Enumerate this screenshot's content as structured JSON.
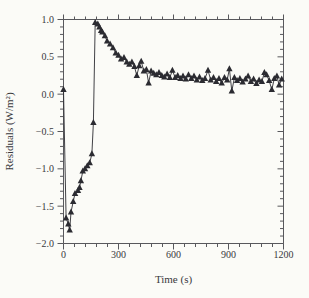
{
  "chart_data": {
    "type": "line",
    "title": "",
    "xlabel": "Time (s)",
    "ylabel": "Residuals (W/m²)",
    "xlim": [
      0,
      1200
    ],
    "ylim": [
      -2.0,
      1.0
    ],
    "x_major_ticks": [
      0,
      300,
      600,
      900,
      1200
    ],
    "x_tick_labels": [
      "0",
      "300",
      "600",
      "900",
      "1200"
    ],
    "x_minor_step": 60,
    "y_major_ticks": [
      1.0,
      0.5,
      0.0,
      -0.5,
      -1.0,
      -1.5,
      -2.0
    ],
    "y_tick_labels": [
      "1.0",
      "0.5",
      "0.0",
      "−0.5",
      "−1.0",
      "−1.5",
      "−2.0"
    ],
    "y_minor_step": 0.1,
    "grid": false,
    "legend_position": "none",
    "marker": "filled-triangle-up",
    "colors": {
      "series": "#2b2b31",
      "axis": "#58585c",
      "text": "#39393d",
      "background": "#fbfbf7"
    },
    "series": [
      {
        "name": "residuals",
        "points": [
          [
            0,
            0.06
          ],
          [
            14,
            -1.66
          ],
          [
            26,
            -1.74
          ],
          [
            34,
            -1.82
          ],
          [
            41,
            -1.58
          ],
          [
            53,
            -1.44
          ],
          [
            63,
            -1.33
          ],
          [
            79,
            -1.29
          ],
          [
            87,
            -1.25
          ],
          [
            95,
            -1.16
          ],
          [
            105,
            -1.03
          ],
          [
            117,
            -1.0
          ],
          [
            130,
            -0.96
          ],
          [
            143,
            -0.92
          ],
          [
            155,
            -0.8
          ],
          [
            163,
            -0.38
          ],
          [
            173,
            0.96
          ],
          [
            187,
            0.94
          ],
          [
            196,
            0.9
          ],
          [
            205,
            0.85
          ],
          [
            212,
            0.83
          ],
          [
            226,
            0.78
          ],
          [
            238,
            0.71
          ],
          [
            254,
            0.67
          ],
          [
            270,
            0.62
          ],
          [
            285,
            0.55
          ],
          [
            300,
            0.52
          ],
          [
            314,
            0.47
          ],
          [
            330,
            0.49
          ],
          [
            345,
            0.43
          ],
          [
            359,
            0.4
          ],
          [
            373,
            0.43
          ],
          [
            387,
            0.37
          ],
          [
            400,
            0.25
          ],
          [
            413,
            0.38
          ],
          [
            424,
            0.44
          ],
          [
            438,
            0.31
          ],
          [
            452,
            0.33
          ],
          [
            464,
            0.15
          ],
          [
            478,
            0.31
          ],
          [
            492,
            0.28
          ],
          [
            506,
            0.26
          ],
          [
            521,
            0.29
          ],
          [
            536,
            0.25
          ],
          [
            550,
            0.23
          ],
          [
            565,
            0.27
          ],
          [
            580,
            0.22
          ],
          [
            594,
            0.32
          ],
          [
            609,
            0.22
          ],
          [
            623,
            0.25
          ],
          [
            638,
            0.21
          ],
          [
            652,
            0.24
          ],
          [
            667,
            0.2
          ],
          [
            682,
            0.26
          ],
          [
            697,
            0.21
          ],
          [
            712,
            0.24
          ],
          [
            727,
            0.19
          ],
          [
            742,
            0.23
          ],
          [
            757,
            0.18
          ],
          [
            772,
            0.21
          ],
          [
            788,
            0.32
          ],
          [
            803,
            0.19
          ],
          [
            818,
            0.22
          ],
          [
            833,
            0.17
          ],
          [
            848,
            0.21
          ],
          [
            863,
            0.15
          ],
          [
            878,
            0.22
          ],
          [
            893,
            0.19
          ],
          [
            905,
            0.34
          ],
          [
            918,
            0.04
          ],
          [
            932,
            0.22
          ],
          [
            947,
            0.18
          ],
          [
            962,
            0.21
          ],
          [
            977,
            0.16
          ],
          [
            992,
            0.2
          ],
          [
            1007,
            0.24
          ],
          [
            1022,
            0.17
          ],
          [
            1037,
            0.2
          ],
          [
            1052,
            0.14
          ],
          [
            1067,
            0.19
          ],
          [
            1082,
            0.17
          ],
          [
            1096,
            0.29
          ],
          [
            1108,
            0.26
          ],
          [
            1122,
            0.18
          ],
          [
            1136,
            0.06
          ],
          [
            1150,
            0.21
          ],
          [
            1164,
            0.24
          ],
          [
            1176,
            0.12
          ],
          [
            1190,
            0.2
          ]
        ]
      }
    ]
  }
}
